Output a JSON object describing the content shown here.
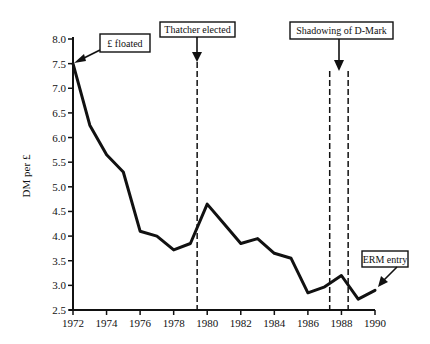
{
  "chart_data": {
    "type": "line",
    "title": "",
    "xlabel": "",
    "ylabel": "DM per £",
    "xlim": [
      1972,
      1990
    ],
    "ylim": [
      2.5,
      8.0
    ],
    "x_ticks": [
      "1972",
      "1974",
      "1976",
      "1978",
      "1980",
      "1982",
      "1984",
      "1986",
      "1988",
      "1990"
    ],
    "y_ticks": [
      "2.5",
      "3.0",
      "3.5",
      "4.0",
      "4.5",
      "5.0",
      "5.5",
      "6.0",
      "6.5",
      "7.0",
      "7.5",
      "8.0"
    ],
    "grid": false,
    "legend": null,
    "series": [
      {
        "name": "DM per £",
        "x": [
          1972,
          1973,
          1974,
          1975,
          1976,
          1977,
          1978,
          1979,
          1980,
          1981,
          1982,
          1983,
          1984,
          1985,
          1986,
          1987,
          1988,
          1989,
          1990
        ],
        "values": [
          7.5,
          6.25,
          5.65,
          5.3,
          4.1,
          4.0,
          3.72,
          3.85,
          4.65,
          4.25,
          3.85,
          3.95,
          3.65,
          3.55,
          2.85,
          2.97,
          3.2,
          2.72,
          2.9
        ]
      }
    ],
    "vertical_lines": [
      {
        "x": 1979.4,
        "style": "dashed"
      },
      {
        "x": 1987.3,
        "style": "dashed"
      },
      {
        "x": 1988.4,
        "style": "dashed"
      }
    ],
    "annotations": [
      {
        "text": "£ floated",
        "target_x": 1972,
        "target_y": 7.5
      },
      {
        "text": "Thatcher elected",
        "target_x": 1979.4
      },
      {
        "text": "Shadowing of D-Mark",
        "target_x": 1987.85
      },
      {
        "text": "ERM entry",
        "target_x": 1990,
        "target_y": 2.9
      }
    ]
  },
  "annotations": {
    "floated": "£ floated",
    "thatcher": "Thatcher elected",
    "shadowing": "Shadowing of D-Mark",
    "erm": "ERM entry"
  },
  "axes": {
    "ylabel": "DM per £"
  }
}
